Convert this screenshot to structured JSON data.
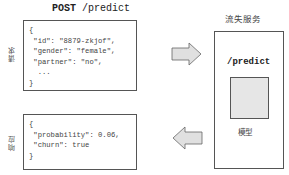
{
  "request": {
    "method": "POST",
    "path": "/predict",
    "side_label": "请求",
    "body_lines": [
      "{",
      " \"id\": \"8879-zkjof\",",
      " \"gender\": \"female\",",
      " \"partner\": \"no\",",
      "  ...",
      "}"
    ]
  },
  "response": {
    "side_label": "响应",
    "body_lines": [
      "{",
      " \"probability\": 0.06,",
      " \"churn\": true",
      "}"
    ]
  },
  "service": {
    "title": "流失服务",
    "endpoint": "/predict",
    "model_label": "模型"
  },
  "arrows": [
    {
      "direction": "right",
      "meaning": "request-to-service"
    },
    {
      "direction": "left",
      "meaning": "service-to-response"
    }
  ],
  "colors": {
    "border": "#555555",
    "arrow_fill": "#e0e0e0",
    "model_fill": "#e6e6e6"
  }
}
